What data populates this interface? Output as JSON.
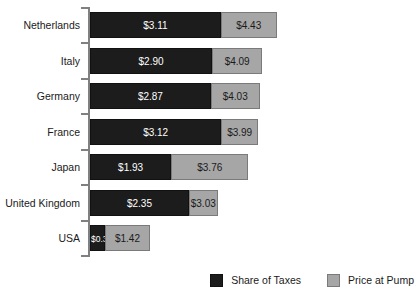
{
  "chart_data": {
    "type": "bar",
    "orientation": "horizontal",
    "stacked": true,
    "title": "",
    "subtitle": "",
    "xlabel": "",
    "ylabel": "",
    "grid": false,
    "legend_position": "bottom-right",
    "categories": [
      "Netherlands",
      "Italy",
      "Germany",
      "France",
      "Japan",
      "United Kingdom",
      "USA"
    ],
    "series": [
      {
        "name": "Share of Taxes",
        "color": "#1c1c1c",
        "values": [
          3.11,
          2.9,
          2.87,
          3.12,
          1.93,
          2.35,
          0.36
        ],
        "labels": [
          "$3.11",
          "$2.90",
          "$2.87",
          "$3.12",
          "$1.93",
          "$2.35",
          "$0.36"
        ]
      },
      {
        "name": "Price at Pump",
        "color": "#a6a6a6",
        "values": [
          4.43,
          4.09,
          4.03,
          3.99,
          3.76,
          3.03,
          1.42
        ],
        "labels": [
          "$4.43",
          "$4.09",
          "$4.03",
          "$3.99",
          "$3.76",
          "$3.03",
          "$1.42"
        ]
      }
    ],
    "xlim": [
      0,
      7.6
    ]
  },
  "legend": {
    "items": [
      {
        "label": "Share of Taxes",
        "swatch": "black-square-icon"
      },
      {
        "label": "Price at Pump",
        "swatch": "gray-square-icon"
      }
    ]
  },
  "rows": [
    {
      "label": "Netherlands",
      "taxes_label": "$3.11",
      "pump_label": "$4.43"
    },
    {
      "label": "Italy",
      "taxes_label": "$2.90",
      "pump_label": "$4.09"
    },
    {
      "label": "Germany",
      "taxes_label": "$2.87",
      "pump_label": "$4.03"
    },
    {
      "label": "France",
      "taxes_label": "$3.12",
      "pump_label": "$3.99"
    },
    {
      "label": "Japan",
      "taxes_label": "$1.93",
      "pump_label": "$3.76"
    },
    {
      "label": "United Kingdom",
      "taxes_label": "$2.35",
      "pump_label": "$3.03"
    },
    {
      "label": "USA",
      "taxes_label": "$0.36",
      "pump_label": "$1.42"
    }
  ],
  "colors": {
    "taxes": "#1c1c1c",
    "pump": "#a6a6a6",
    "axis": "#808080",
    "text": "#1a1a1a",
    "background": "#ffffff"
  }
}
